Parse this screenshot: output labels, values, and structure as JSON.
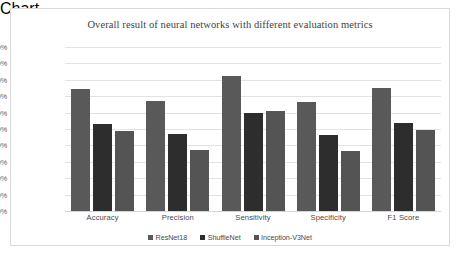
{
  "chart_data": {
    "type": "bar",
    "title": "Overall result of neural networks with different evaluation metrics",
    "xlabel": "",
    "ylabel": "",
    "ylim": [
      95.0,
      100.0
    ],
    "ytick_step": 0.5,
    "ytick_labels": [
      "100.00%",
      "99.50%",
      "99.00%",
      "98.50%",
      "98.00%",
      "97.50%",
      "97.00%",
      "96.50%",
      "96.00%",
      "95.50%",
      "95.00%"
    ],
    "ytick_values": [
      100.0,
      99.5,
      99.0,
      98.5,
      98.0,
      97.5,
      97.0,
      96.5,
      96.0,
      95.5,
      95.0
    ],
    "categories": [
      "Accuracy",
      "Precision",
      "Sensitivity",
      "Specificity",
      "F1 Score"
    ],
    "grid": true,
    "legend_position": "bottom",
    "series": [
      {
        "name": "ResNet18",
        "color": "#595959",
        "values": [
          98.72,
          98.35,
          99.13,
          98.32,
          98.75
        ]
      },
      {
        "name": "ShuffleNet",
        "color": "#2d2d2d",
        "values": [
          97.65,
          97.34,
          97.99,
          97.31,
          97.67
        ]
      },
      {
        "name": "Inception-V3Net",
        "color": "#545454",
        "values": [
          97.44,
          96.87,
          98.05,
          96.82,
          97.48
        ]
      }
    ]
  },
  "colors": {
    "background": "#ffffff",
    "frame_border": "#d9d9d9",
    "gridline": "#e3e3e3",
    "title_text": "#3f3f3f",
    "axis_text": "#5b5b5b"
  }
}
